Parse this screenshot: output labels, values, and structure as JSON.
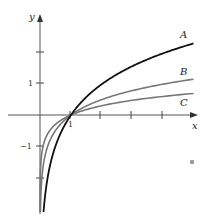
{
  "chart_data": {
    "type": "line",
    "title": "",
    "xlabel": "x",
    "ylabel": "y",
    "xlim": [
      -0.4,
      5.1
    ],
    "ylim": [
      -3.1,
      3.2
    ],
    "grid": false,
    "legend": "inline labels at right end of curves",
    "x_ticks": [
      1,
      2,
      3,
      4
    ],
    "x_tick_labels": [
      "1",
      "",
      "",
      ""
    ],
    "y_ticks": [
      -2,
      -1,
      1,
      2
    ],
    "y_tick_labels": [
      "",
      "−1",
      "1",
      ""
    ],
    "series": [
      {
        "name": "A",
        "function": "log base 2 of x",
        "base": 2,
        "color": "#111111",
        "x_range": [
          0.12,
          4.95
        ],
        "sample_points": [
          [
            0.125,
            -3
          ],
          [
            0.5,
            -1
          ],
          [
            1,
            0
          ],
          [
            2,
            1
          ],
          [
            4,
            2
          ],
          [
            4.95,
            2.31
          ]
        ]
      },
      {
        "name": "B",
        "function": "log base 4 of x",
        "base": 4,
        "color": "#777777",
        "x_range": [
          0.013,
          4.95
        ],
        "sample_points": [
          [
            0.0156,
            -3
          ],
          [
            0.25,
            -1
          ],
          [
            1,
            0
          ],
          [
            4,
            1
          ],
          [
            4.95,
            1.15
          ]
        ]
      },
      {
        "name": "C",
        "function": "log base 10 of x",
        "base": 10,
        "color": "#777777",
        "x_range": [
          0.001,
          4.95
        ],
        "sample_points": [
          [
            0.001,
            -3
          ],
          [
            0.1,
            -1
          ],
          [
            1,
            0
          ],
          [
            4.95,
            0.69
          ]
        ]
      }
    ]
  },
  "axes": {
    "x_label": "x",
    "y_label": "y",
    "tick_one_x": "1",
    "tick_one_y": "1",
    "tick_neg_one_y": "−1"
  },
  "labels": {
    "A": "A",
    "B": "B",
    "C": "C"
  }
}
